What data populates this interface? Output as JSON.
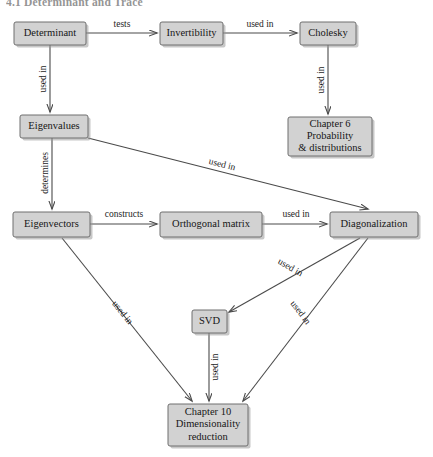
{
  "heading": "4.1  Determinant and Trace",
  "colors": {
    "node_fill": "#d2d2d2",
    "node_stroke": "#6f6f6f",
    "edge": "#4a4a4a",
    "text": "#161616",
    "background": "#ffffff"
  },
  "nodes": [
    {
      "id": "determinant",
      "label": "Determinant",
      "lines": [
        "Determinant"
      ],
      "x": 14,
      "y": 22,
      "w": 72,
      "h": 23
    },
    {
      "id": "invertibility",
      "label": "Invertibility",
      "lines": [
        "Invertibility"
      ],
      "x": 160,
      "y": 22,
      "w": 63,
      "h": 23
    },
    {
      "id": "cholesky",
      "label": "Cholesky",
      "lines": [
        "Cholesky"
      ],
      "x": 300,
      "y": 22,
      "w": 56,
      "h": 23
    },
    {
      "id": "chapter6",
      "label": "Chapter 6 Probability & distributions",
      "lines": [
        "Chapter 6",
        "Probability",
        "& distributions"
      ],
      "x": 288,
      "y": 117,
      "w": 84,
      "h": 39
    },
    {
      "id": "eigenvalues",
      "label": "Eigenvalues",
      "lines": [
        "Eigenvalues"
      ],
      "x": 20,
      "y": 115,
      "w": 68,
      "h": 23
    },
    {
      "id": "eigenvectors",
      "label": "Eigenvectors",
      "lines": [
        "Eigenvectors"
      ],
      "x": 13,
      "y": 212,
      "w": 77,
      "h": 25
    },
    {
      "id": "orthogonal",
      "label": "Orthogonal matrix",
      "lines": [
        "Orthogonal matrix"
      ],
      "x": 160,
      "y": 212,
      "w": 102,
      "h": 25
    },
    {
      "id": "diagonalization",
      "label": "Diagonalization",
      "lines": [
        "Diagonalization"
      ],
      "x": 330,
      "y": 212,
      "w": 88,
      "h": 25
    },
    {
      "id": "svd",
      "label": "SVD",
      "lines": [
        "SVD"
      ],
      "x": 192,
      "y": 310,
      "w": 35,
      "h": 23
    },
    {
      "id": "chapter10",
      "label": "Chapter 10 Dimensionality reduction",
      "lines": [
        "Chapter 10",
        "Dimensionality",
        "reduction"
      ],
      "x": 168,
      "y": 404,
      "w": 80,
      "h": 42
    }
  ],
  "edges": [
    {
      "id": "determinant-invertibility",
      "from": "determinant",
      "to": "invertibility",
      "label": "tests",
      "x1": 86,
      "y1": 33,
      "x2": 157,
      "y2": 33,
      "lx": 122,
      "ly": 25,
      "rot": 0
    },
    {
      "id": "invertibility-cholesky",
      "from": "invertibility",
      "to": "cholesky",
      "label": "used in",
      "x1": 223,
      "y1": 33,
      "x2": 297,
      "y2": 33,
      "lx": 260,
      "ly": 25,
      "rot": 0
    },
    {
      "id": "determinant-eigenvalues",
      "from": "determinant",
      "to": "eigenvalues",
      "label": "used in",
      "x1": 50,
      "y1": 45,
      "x2": 50,
      "y2": 112,
      "lx": 44,
      "ly": 79,
      "rot": -90
    },
    {
      "id": "cholesky-chapter6",
      "from": "cholesky",
      "to": "chapter6",
      "label": "used in",
      "x1": 328,
      "y1": 45,
      "x2": 328,
      "y2": 114,
      "lx": 322,
      "ly": 80,
      "rot": -90
    },
    {
      "id": "eigenvalues-eigenvectors",
      "from": "eigenvalues",
      "to": "eigenvectors",
      "label": "determines",
      "x1": 52,
      "y1": 138,
      "x2": 52,
      "y2": 209,
      "lx": 46,
      "ly": 173,
      "rot": -90
    },
    {
      "id": "eigenvalues-diagonalization",
      "from": "eigenvalues",
      "to": "diagonalization",
      "label": "used in",
      "x1": 88,
      "y1": 138,
      "x2": 368,
      "y2": 209,
      "lx": 222,
      "ly": 165,
      "rot": 14
    },
    {
      "id": "eigenvectors-orthogonal",
      "from": "eigenvectors",
      "to": "orthogonal",
      "label": "constructs",
      "x1": 90,
      "y1": 224,
      "x2": 157,
      "y2": 224,
      "lx": 124,
      "ly": 215,
      "rot": 0
    },
    {
      "id": "orthogonal-diagonalization",
      "from": "orthogonal",
      "to": "diagonalization",
      "label": "used in",
      "x1": 262,
      "y1": 224,
      "x2": 327,
      "y2": 224,
      "lx": 296,
      "ly": 215,
      "rot": 0
    },
    {
      "id": "diagonalization-svd",
      "from": "diagonalization",
      "to": "svd",
      "label": "used in",
      "x1": 360,
      "y1": 238,
      "x2": 229,
      "y2": 312,
      "lx": 290,
      "ly": 268,
      "rot": 30
    },
    {
      "id": "diagonalization-chapter10",
      "from": "diagonalization",
      "to": "chapter10",
      "label": "used in",
      "x1": 368,
      "y1": 238,
      "x2": 243,
      "y2": 401,
      "lx": 300,
      "ly": 313,
      "rot": 53
    },
    {
      "id": "eigenvectors-chapter10",
      "from": "eigenvectors",
      "to": "chapter10",
      "label": "used in",
      "x1": 62,
      "y1": 238,
      "x2": 192,
      "y2": 401,
      "lx": 122,
      "ly": 313,
      "rot": 51
    },
    {
      "id": "svd-chapter10",
      "from": "svd",
      "to": "chapter10",
      "label": "used in",
      "x1": 209,
      "y1": 333,
      "x2": 209,
      "y2": 401,
      "lx": 216,
      "ly": 367,
      "rot": -90
    }
  ]
}
